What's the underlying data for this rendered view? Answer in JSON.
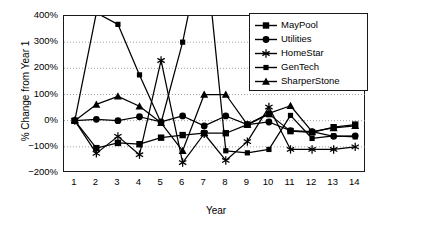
{
  "chart_data": {
    "type": "line",
    "title": "",
    "xlabel": "Year",
    "ylabel": "% Change from Year 1",
    "x": [
      1,
      2,
      3,
      4,
      5,
      6,
      7,
      8,
      9,
      10,
      11,
      12,
      13,
      14
    ],
    "xticklabels": [
      "1",
      "2",
      "3",
      "4",
      "5",
      "6",
      "7",
      "8",
      "9",
      "10",
      "11",
      "12",
      "13",
      "14"
    ],
    "yticklabels": [
      "400%",
      "300%",
      "200%",
      "100%",
      "0%",
      "-100%",
      "-200%"
    ],
    "ytickvalues": [
      400,
      300,
      200,
      100,
      0,
      -100,
      -200
    ],
    "ylim": [
      -200,
      400
    ],
    "xlim": [
      0.5,
      14.5
    ],
    "grid": "horizontal-dotted",
    "legend_position": "top-right",
    "series": [
      {
        "name": "MayPool",
        "marker": "square",
        "values": [
          0,
          -105,
          -85,
          -90,
          -65,
          -55,
          -48,
          -48,
          -15,
          25,
          -40,
          -45,
          -25,
          -15
        ]
      },
      {
        "name": "Utilities",
        "marker": "circle",
        "values": [
          0,
          5,
          0,
          15,
          -5,
          18,
          -20,
          18,
          -15,
          -5,
          -38,
          -42,
          -60,
          -58
        ]
      },
      {
        "name": "HomeStar",
        "marker": "asterisk",
        "values": [
          0,
          -125,
          -60,
          -130,
          230,
          -160,
          -50,
          -152,
          -80,
          52,
          -110,
          -110,
          -110,
          -100
        ]
      },
      {
        "name": "GenTech",
        "marker": "dash",
        "values": [
          0,
          412,
          368,
          175,
          -8,
          300,
          700,
          -115,
          -123,
          -110,
          20,
          -68,
          -58,
          -62
        ]
      },
      {
        "name": "SharperStone",
        "marker": "triangle",
        "values": [
          0,
          62,
          93,
          55,
          -8,
          -115,
          100,
          100,
          -15,
          28,
          57,
          -42,
          -28,
          -20
        ]
      }
    ]
  },
  "legend": {
    "items": [
      {
        "label": "MayPool"
      },
      {
        "label": "Utilities"
      },
      {
        "label": "HomeStar"
      },
      {
        "label": "GenTech"
      },
      {
        "label": "SharperStone"
      }
    ]
  }
}
